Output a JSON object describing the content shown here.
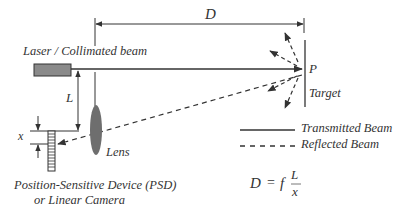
{
  "diagram": {
    "labels": {
      "distance": "D",
      "laser": "Laser / Collimated beam",
      "baseline": "L",
      "offset": "x",
      "point": "P",
      "target": "Target",
      "lens": "Lens",
      "psd_line1": "Position-Sensitive Device (PSD)",
      "psd_line2": "or Linear Camera"
    },
    "legend": [
      {
        "style": "solid",
        "label": "Transmitted Beam"
      },
      {
        "style": "dashed",
        "label": "Reflected Beam"
      }
    ],
    "formula": {
      "lhs": "D",
      "equals": "=",
      "f": "f",
      "numerator": "L",
      "denominator": "x"
    },
    "colors": {
      "line": "#333333",
      "laser_fill": "#8a8a8a",
      "lens_fill": "#6e6e6e",
      "text": "#333333"
    }
  }
}
